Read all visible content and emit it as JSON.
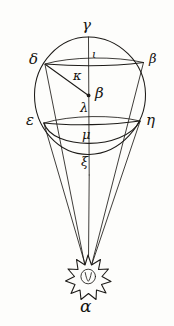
{
  "figure": {
    "background_color": "#fdfdfb",
    "ink_color": "#1d1b18",
    "width": 174,
    "height": 326
  },
  "labels": {
    "apex_top": "γ",
    "upper_chord_left": "δ",
    "upper_chord_right": "β",
    "upper_axis": "ι",
    "chord_mid": "κ",
    "center": "β",
    "below_center": "λ",
    "lower_chord_left": "ε",
    "lower_chord_right": "η",
    "lower_axis": "μ",
    "below_sphere": "ξ",
    "star_label": "α"
  },
  "points": {
    "gamma": {
      "x": 88,
      "y": 37,
      "name": "sphere-top-pole"
    },
    "delta": {
      "x": 45,
      "y": 64,
      "name": "upper-chord-left-end"
    },
    "beta_right": {
      "x": 144,
      "y": 62,
      "name": "upper-chord-right-end"
    },
    "beta_center": {
      "x": 89,
      "y": 95,
      "name": "sphere-center"
    },
    "epsilon": {
      "x": 44,
      "y": 123,
      "name": "lower-chord-left-end"
    },
    "eta": {
      "x": 140,
      "y": 121,
      "name": "lower-chord-right-end"
    },
    "alpha": {
      "x": 88,
      "y": 272,
      "name": "star-apex"
    }
  },
  "circle": {
    "center_x": 90,
    "center_y": 96,
    "radius_x": 55,
    "radius_y": 59
  },
  "star": {
    "center_x": 88,
    "center_y": 272,
    "outer_radius": 17,
    "inner_radius": 9,
    "points": 12
  }
}
